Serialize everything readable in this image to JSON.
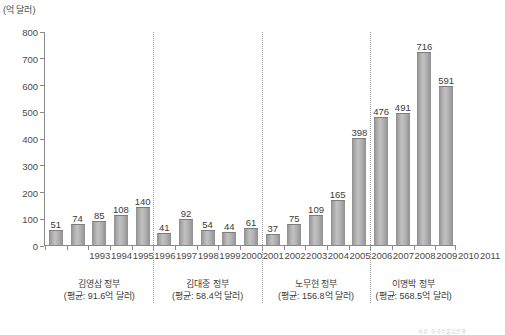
{
  "unit_label": "(억 달러)",
  "source_note": "자료: 한국수출입은행",
  "axis": {
    "y_ticks": [
      0,
      100,
      200,
      300,
      400,
      500,
      600,
      700,
      800
    ],
    "y_min": 0,
    "y_max": 800
  },
  "chart_data": {
    "type": "bar",
    "title": "",
    "xlabel": "",
    "ylabel": "(억 달러)",
    "ylim": [
      0,
      800
    ],
    "grid": false,
    "legend": "none",
    "categories": [
      "1993",
      "1994",
      "1995",
      "1996",
      "1997",
      "1998",
      "1999",
      "2000",
      "2001",
      "2002",
      "2003",
      "2004",
      "2005",
      "2006",
      "2007",
      "2008",
      "2009",
      "2010",
      "2011"
    ],
    "values": [
      51,
      74,
      85,
      108,
      140,
      41,
      92,
      54,
      44,
      61,
      37,
      75,
      109,
      165,
      398,
      476,
      491,
      716,
      591
    ],
    "groups": [
      {
        "name": "김영삼 정부",
        "average_label": "(평균: 91.6억 달러)",
        "average": 91.6,
        "years": [
          "1993",
          "1994",
          "1995",
          "1996",
          "1997"
        ]
      },
      {
        "name": "김대중 정부",
        "average_label": "(평균: 58.4억 달러)",
        "average": 58.4,
        "years": [
          "1998",
          "1999",
          "2000",
          "2001",
          "2002"
        ]
      },
      {
        "name": "노무현 정부",
        "average_label": "(평균: 156.8억 달러)",
        "average": 156.8,
        "years": [
          "2003",
          "2004",
          "2005",
          "2006",
          "2007"
        ]
      },
      {
        "name": "이명박 정부",
        "average_label": "(평균: 568.5억 달러)",
        "average": 568.5,
        "years": [
          "2008",
          "2009",
          "2010",
          "2011"
        ]
      }
    ]
  }
}
